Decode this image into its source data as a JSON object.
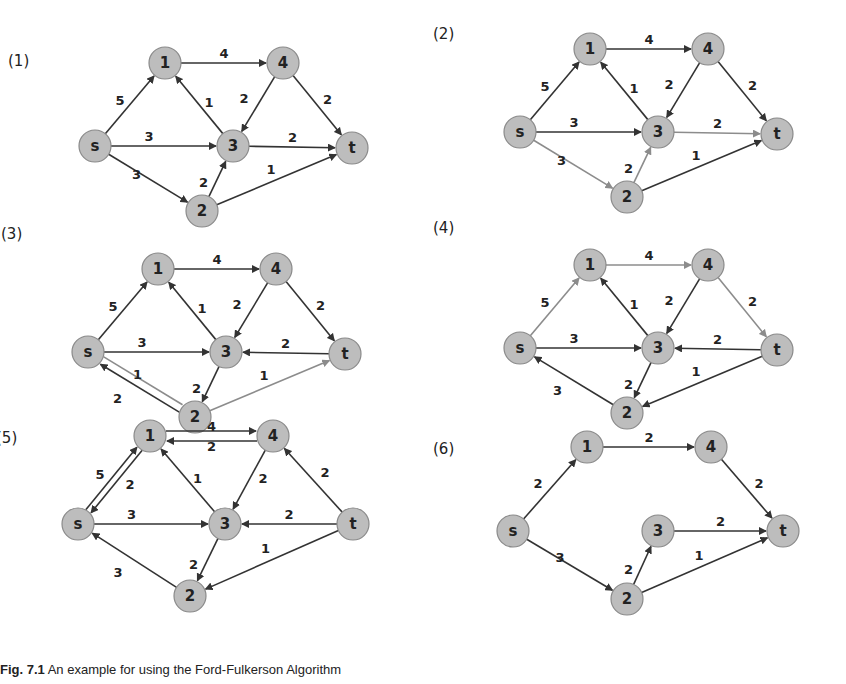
{
  "figure": {
    "caption_prefix": "Fig. 7.1",
    "caption_text": "An example for using the Ford-Fulkerson Algorithm",
    "colors": {
      "node_fill": "#bdbdbd",
      "edge": "#333333",
      "edge_highlight": "#8c8c8c"
    }
  },
  "panels": [
    {
      "id": "panel-1",
      "label": "(1)",
      "label_pos": [
        8,
        62
      ],
      "origin": [
        0,
        0
      ],
      "nodes": {
        "s": [
          95,
          146
        ],
        "1": [
          165,
          63
        ],
        "4": [
          283,
          63
        ],
        "3": [
          233,
          146
        ],
        "t": [
          352,
          148
        ],
        "2": [
          202,
          211
        ]
      },
      "edges": [
        {
          "from": "s",
          "to": "1",
          "w": "5",
          "lp": [
            -10,
            -4
          ]
        },
        {
          "from": "1",
          "to": "4",
          "w": "4",
          "lp": [
            0,
            -10
          ]
        },
        {
          "from": "3",
          "to": "1",
          "w": "1",
          "lp": [
            10,
            -2
          ]
        },
        {
          "from": "4",
          "to": "3",
          "w": "2",
          "lp": [
            -14,
            -6
          ]
        },
        {
          "from": "4",
          "to": "t",
          "w": "2",
          "lp": [
            10,
            -6
          ]
        },
        {
          "from": "s",
          "to": "3",
          "w": "3",
          "lp": [
            -15,
            -10
          ]
        },
        {
          "from": "3",
          "to": "t",
          "w": "2",
          "lp": [
            0,
            -10
          ]
        },
        {
          "from": "s",
          "to": "2",
          "w": "3",
          "lp": [
            -12,
            -4
          ]
        },
        {
          "from": "2",
          "to": "3",
          "w": "2",
          "lp": [
            -14,
            4
          ]
        },
        {
          "from": "2",
          "to": "t",
          "w": "1",
          "lp": [
            -6,
            -10
          ]
        }
      ]
    },
    {
      "id": "panel-2",
      "label": "(2)",
      "label_pos": [
        8,
        49
      ],
      "origin": [
        425,
        -14
      ],
      "nodes": {
        "s": [
          95,
          146
        ],
        "1": [
          165,
          63
        ],
        "4": [
          283,
          63
        ],
        "3": [
          233,
          146
        ],
        "t": [
          352,
          148
        ],
        "2": [
          202,
          211
        ]
      },
      "edges": [
        {
          "from": "s",
          "to": "1",
          "w": "5",
          "lp": [
            -10,
            -4
          ]
        },
        {
          "from": "1",
          "to": "4",
          "w": "4",
          "lp": [
            0,
            -10
          ]
        },
        {
          "from": "3",
          "to": "1",
          "w": "1",
          "lp": [
            10,
            -2
          ]
        },
        {
          "from": "4",
          "to": "3",
          "w": "2",
          "lp": [
            -14,
            -6
          ]
        },
        {
          "from": "4",
          "to": "t",
          "w": "2",
          "lp": [
            10,
            -6
          ]
        },
        {
          "from": "s",
          "to": "3",
          "w": "3",
          "lp": [
            -15,
            -10
          ]
        },
        {
          "from": "3",
          "to": "t",
          "w": "2",
          "lp": [
            0,
            -10
          ],
          "hl": true
        },
        {
          "from": "s",
          "to": "2",
          "w": "3",
          "lp": [
            -12,
            -4
          ],
          "hl": true
        },
        {
          "from": "2",
          "to": "3",
          "w": "2",
          "lp": [
            -14,
            4
          ],
          "hl": true
        },
        {
          "from": "2",
          "to": "t",
          "w": "1",
          "lp": [
            -6,
            -10
          ]
        }
      ]
    },
    {
      "id": "panel-3",
      "label": "(3)",
      "label_pos": [
        8,
        29
      ],
      "origin": [
        -7,
        206
      ],
      "nodes": {
        "s": [
          95,
          146
        ],
        "1": [
          165,
          63
        ],
        "4": [
          283,
          63
        ],
        "3": [
          233,
          146
        ],
        "t": [
          352,
          148
        ],
        "2": [
          202,
          211
        ]
      },
      "edges": [
        {
          "from": "s",
          "to": "1",
          "w": "5",
          "lp": [
            -10,
            -4
          ]
        },
        {
          "from": "1",
          "to": "4",
          "w": "4",
          "lp": [
            0,
            -10
          ]
        },
        {
          "from": "3",
          "to": "1",
          "w": "1",
          "lp": [
            10,
            -2
          ]
        },
        {
          "from": "4",
          "to": "3",
          "w": "2",
          "lp": [
            -14,
            -6
          ]
        },
        {
          "from": "4",
          "to": "t",
          "w": "2",
          "lp": [
            10,
            -6
          ]
        },
        {
          "from": "s",
          "to": "3",
          "w": "3",
          "lp": [
            -15,
            -10
          ]
        },
        {
          "from": "t",
          "to": "3",
          "w": "2",
          "lp": [
            0,
            -10
          ]
        },
        {
          "from": "s",
          "to": "2",
          "w": "1",
          "lp": [
            -4,
            -10
          ],
          "off": -4,
          "hl": true,
          "noarrow": true
        },
        {
          "from": "2",
          "to": "s",
          "w": "2",
          "lp": [
            -24,
            14
          ],
          "off": -4
        },
        {
          "from": "3",
          "to": "2",
          "w": "2",
          "lp": [
            -14,
            4
          ]
        },
        {
          "from": "2",
          "to": "t",
          "w": "1",
          "lp": [
            -6,
            -10
          ],
          "hl": true
        }
      ]
    },
    {
      "id": "panel-4",
      "label": "(4)",
      "label_pos": [
        8,
        27
      ],
      "origin": [
        425,
        202
      ],
      "nodes": {
        "s": [
          95,
          146
        ],
        "1": [
          165,
          63
        ],
        "4": [
          283,
          63
        ],
        "3": [
          233,
          146
        ],
        "t": [
          352,
          148
        ],
        "2": [
          202,
          211
        ]
      },
      "edges": [
        {
          "from": "s",
          "to": "1",
          "w": "5",
          "lp": [
            -10,
            -4
          ],
          "hl": true
        },
        {
          "from": "1",
          "to": "4",
          "w": "4",
          "lp": [
            0,
            -10
          ],
          "hl": true
        },
        {
          "from": "3",
          "to": "1",
          "w": "1",
          "lp": [
            10,
            -2
          ]
        },
        {
          "from": "4",
          "to": "3",
          "w": "2",
          "lp": [
            -14,
            -6
          ]
        },
        {
          "from": "4",
          "to": "t",
          "w": "2",
          "lp": [
            10,
            -6
          ],
          "hl": true
        },
        {
          "from": "s",
          "to": "3",
          "w": "3",
          "lp": [
            -15,
            -10
          ]
        },
        {
          "from": "t",
          "to": "3",
          "w": "2",
          "lp": [
            0,
            -10
          ]
        },
        {
          "from": "2",
          "to": "s",
          "w": "3",
          "lp": [
            -16,
            10
          ]
        },
        {
          "from": "3",
          "to": "2",
          "w": "2",
          "lp": [
            -14,
            4
          ]
        },
        {
          "from": "t",
          "to": "2",
          "w": "1",
          "lp": [
            -6,
            -10
          ]
        }
      ]
    },
    {
      "id": "panel-5",
      "label": "(5)",
      "label_pos": [
        8,
        38
      ],
      "origin": [
        -12,
        401
      ],
      "nodes": {
        "s": [
          90,
          123
        ],
        "1": [
          162,
          35
        ],
        "4": [
          285,
          35
        ],
        "3": [
          237,
          123
        ],
        "t": [
          365,
          123
        ],
        "2": [
          202,
          195
        ]
      },
      "edges": [
        {
          "from": "s",
          "to": "1",
          "w": "5",
          "lp": [
            -14,
            -6
          ],
          "off": -3
        },
        {
          "from": "1",
          "to": "s",
          "w": "2",
          "lp": [
            16,
            4
          ],
          "off": -3
        },
        {
          "from": "1",
          "to": "4",
          "w": "4",
          "lp": [
            0,
            -10
          ],
          "off": -5
        },
        {
          "from": "4",
          "to": "1",
          "w": "2",
          "lp": [
            0,
            10
          ],
          "off": -5
        },
        {
          "from": "3",
          "to": "1",
          "w": "1",
          "lp": [
            10,
            -2
          ]
        },
        {
          "from": "4",
          "to": "3",
          "w": "2",
          "lp": [
            14,
            -2
          ]
        },
        {
          "from": "t",
          "to": "4",
          "w": "2",
          "lp": [
            12,
            -8
          ]
        },
        {
          "from": "s",
          "to": "3",
          "w": "3",
          "lp": [
            -20,
            -10
          ]
        },
        {
          "from": "t",
          "to": "3",
          "w": "2",
          "lp": [
            0,
            -10
          ]
        },
        {
          "from": "2",
          "to": "s",
          "w": "3",
          "lp": [
            -16,
            12
          ]
        },
        {
          "from": "3",
          "to": "2",
          "w": "2",
          "lp": [
            -14,
            4
          ]
        },
        {
          "from": "t",
          "to": "2",
          "w": "1",
          "lp": [
            -6,
            -12
          ]
        }
      ]
    },
    {
      "id": "panel-6",
      "label": "(6)",
      "label_pos": [
        8,
        44
      ],
      "origin": [
        425,
        406
      ],
      "nodes": {
        "s": [
          88,
          125
        ],
        "1": [
          162,
          41
        ],
        "4": [
          286,
          41
        ],
        "3": [
          233,
          125
        ],
        "t": [
          358,
          125
        ],
        "2": [
          202,
          193
        ]
      },
      "edges": [
        {
          "from": "s",
          "to": "1",
          "w": "2",
          "lp": [
            -12,
            -6
          ]
        },
        {
          "from": "1",
          "to": "4",
          "w": "2",
          "lp": [
            0,
            -10
          ]
        },
        {
          "from": "4",
          "to": "t",
          "w": "2",
          "lp": [
            12,
            -6
          ]
        },
        {
          "from": "3",
          "to": "t",
          "w": "2",
          "lp": [
            0,
            -10
          ]
        },
        {
          "from": "s",
          "to": "2",
          "w": "3",
          "lp": [
            -10,
            -8
          ]
        },
        {
          "from": "2",
          "to": "3",
          "w": "2",
          "lp": [
            -14,
            4
          ]
        },
        {
          "from": "2",
          "to": "t",
          "w": "1",
          "lp": [
            -6,
            -10
          ]
        }
      ]
    }
  ]
}
